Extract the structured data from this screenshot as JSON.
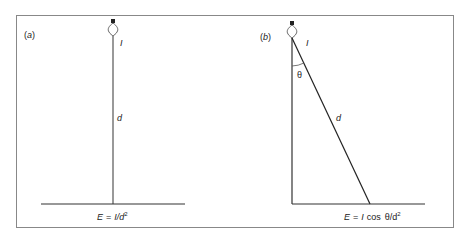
{
  "figure": {
    "panel_a": {
      "label": "(a)",
      "intensity_label": "I",
      "distance_label": "d",
      "formula": {
        "lhs": "E",
        "eq": "=",
        "rhs": "I/d",
        "exp": "2"
      }
    },
    "panel_b": {
      "label": "(b)",
      "intensity_label": "I",
      "angle_label": "θ",
      "distance_label": "d",
      "formula": {
        "lhs": "E",
        "eq": "=",
        "rhs_i": "I",
        "rhs_cos": "cos",
        "rhs_theta": "θ/d",
        "exp": "2"
      }
    }
  }
}
